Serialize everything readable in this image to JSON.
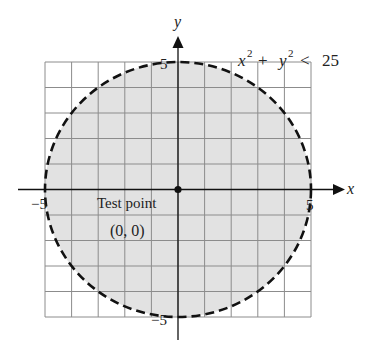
{
  "figure": {
    "inequality": {
      "x_var": "x",
      "x_exp": "2",
      "plus": "+",
      "y_var": "y",
      "y_exp": "2",
      "rel": "<",
      "rhs": "25"
    },
    "axes": {
      "x_label": "x",
      "y_label": "y",
      "ticks": {
        "x_min": "−5",
        "x_max": "5",
        "y_min": "−5",
        "y_max": "5"
      }
    },
    "test_point": {
      "label": "Test point",
      "coords": "(0, 0)"
    },
    "colors": {
      "shade": "#e2e2e2",
      "grid": "#8c8c8c",
      "boundary": "#111111",
      "axis": "#111111"
    }
  },
  "chart_data": {
    "type": "region",
    "title": "",
    "inequality": "x^2 + y^2 < 25",
    "boundary": {
      "shape": "circle",
      "center": [
        0,
        0
      ],
      "radius": 5,
      "style": "dashed"
    },
    "shaded_region": "interior of circle",
    "test_point": {
      "label": "Test point",
      "x": 0,
      "y": 0
    },
    "xlabel": "x",
    "ylabel": "y",
    "xlim": [
      -5,
      5
    ],
    "ylim": [
      -5,
      5
    ],
    "grid": true,
    "grid_step": 1,
    "tick_labels": {
      "x": [
        "-5",
        "5"
      ],
      "y": [
        "-5",
        "5"
      ]
    }
  }
}
